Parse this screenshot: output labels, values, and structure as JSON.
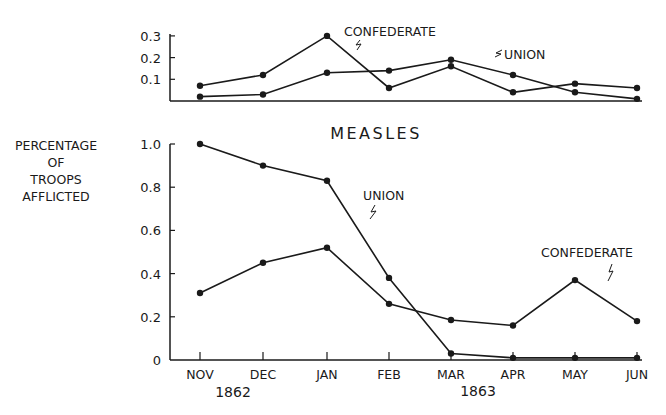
{
  "chart_data": [
    {
      "type": "line",
      "title": "",
      "xlabel": "",
      "ylabel": "",
      "categories": [
        "NOV",
        "DEC",
        "JAN",
        "FEB",
        "MAR",
        "APR",
        "MAY",
        "JUN"
      ],
      "yticks": [
        "0.1",
        "0.2",
        "0.3"
      ],
      "ylim": [
        0,
        0.3
      ],
      "grid": false,
      "series": [
        {
          "name": "CONFEDERATE",
          "values": [
            0.07,
            0.12,
            0.3,
            0.06,
            0.16,
            0.04,
            0.08,
            0.06
          ]
        },
        {
          "name": "UNION",
          "values": [
            0.02,
            0.03,
            0.13,
            0.14,
            0.19,
            0.12,
            0.04,
            0.01
          ]
        }
      ],
      "annotations": [
        "CONFEDERATE",
        "UNION"
      ]
    },
    {
      "type": "line",
      "title": "MEASLES",
      "xlabel": "",
      "ylabel": "PERCENTAGE OF TROOPS AFFLICTED",
      "categories": [
        "NOV",
        "DEC",
        "JAN",
        "FEB",
        "MAR",
        "APR",
        "MAY",
        "JUN"
      ],
      "year_labels": [
        "1862",
        "1863"
      ],
      "yticks": [
        "0",
        "0.2",
        "0.4",
        "0.6",
        "0.8",
        "1.0"
      ],
      "ylim": [
        0,
        1.0
      ],
      "grid": false,
      "series": [
        {
          "name": "UNION",
          "values": [
            1.0,
            0.9,
            0.83,
            0.38,
            0.03,
            0.01,
            0.01,
            0.01
          ]
        },
        {
          "name": "CONFEDERATE",
          "values": [
            0.31,
            0.45,
            0.52,
            0.26,
            0.185,
            0.16,
            0.37,
            0.18
          ]
        }
      ],
      "annotations": [
        "UNION",
        "CONFEDERATE"
      ]
    }
  ],
  "labels": {
    "ylabel_lines": [
      "PERCENTAGE",
      "OF",
      "TROOPS",
      "AFFLICTED"
    ],
    "title": "MEASLES",
    "year_1862": "1862",
    "year_1863": "1863",
    "top_confederate": "CONFEDERATE",
    "top_union": "UNION",
    "bottom_union": "UNION",
    "bottom_confederate": "CONFEDERATE"
  },
  "colors": {
    "ink": "#1a1a1a",
    "background": "#ffffff"
  }
}
